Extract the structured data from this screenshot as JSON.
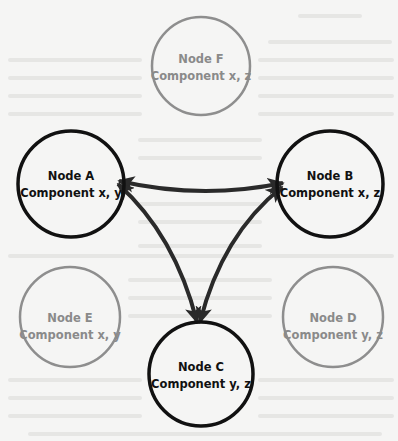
{
  "colors": {
    "background": "#f5f5f4",
    "active_stroke": "#111111",
    "inactive_stroke": "#8e8e8e",
    "arrow": "#2a2a2a",
    "bleed_text": "#e4e4e2"
  },
  "nodes": [
    {
      "id": "F",
      "title": "Node F",
      "components": "Component x, z",
      "active": false,
      "cx": 201,
      "cy": 66,
      "r": 49
    },
    {
      "id": "A",
      "title": "Node A",
      "components": "Component x, y",
      "active": true,
      "cx": 71,
      "cy": 184,
      "r": 53
    },
    {
      "id": "B",
      "title": "Node B",
      "components": "Component x, z",
      "active": true,
      "cx": 330,
      "cy": 184,
      "r": 53
    },
    {
      "id": "E",
      "title": "Node E",
      "components": "Component x, y",
      "active": false,
      "cx": 70,
      "cy": 317,
      "r": 50
    },
    {
      "id": "D",
      "title": "Node D",
      "components": "Component y, z",
      "active": false,
      "cx": 333,
      "cy": 317,
      "r": 50
    },
    {
      "id": "C",
      "title": "Node C",
      "components": "Component y, z",
      "active": true,
      "cx": 201,
      "cy": 374,
      "r": 52
    }
  ],
  "edges": [
    {
      "from": "A",
      "to": "B",
      "bidirectional": true
    },
    {
      "from": "A",
      "to": "C",
      "bidirectional": true
    },
    {
      "from": "B",
      "to": "C",
      "bidirectional": true
    }
  ]
}
